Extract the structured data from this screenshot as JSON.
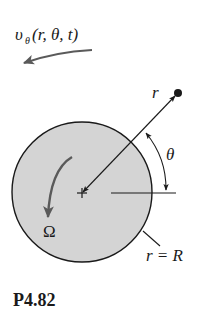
{
  "figure": {
    "caption": "P4.82",
    "velocity_label": {
      "base": "υ",
      "subscript": "θ",
      "args": "(r, θ, t)"
    },
    "radius_label": "r",
    "angle_label": "θ",
    "rotation_label": "Ω",
    "boundary_label": "r = R"
  },
  "colors": {
    "disk_fill": "#d4d4d4",
    "line": "#1a1a1a",
    "arrow_gray": "#5a5a5a"
  }
}
